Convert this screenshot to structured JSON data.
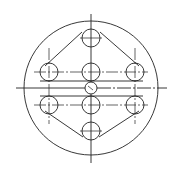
{
  "diagram": {
    "type": "technical-drawing",
    "stroke_color": "#222222",
    "background": "#ffffff",
    "outer_circle": {
      "cx": 91,
      "cy": 88,
      "r": 67
    },
    "center_hole": {
      "cx": 91,
      "cy": 88,
      "r": 6
    },
    "holes": [
      {
        "id": "top",
        "cx": 91,
        "cy": 38,
        "r": 9
      },
      {
        "id": "upper-left",
        "cx": 49,
        "cy": 72,
        "r": 9
      },
      {
        "id": "upper-center",
        "cx": 91,
        "cy": 72,
        "r": 9
      },
      {
        "id": "upper-right",
        "cx": 135,
        "cy": 72,
        "r": 9
      },
      {
        "id": "lower-left",
        "cx": 49,
        "cy": 105,
        "r": 9
      },
      {
        "id": "lower-center",
        "cx": 91,
        "cy": 105,
        "r": 9
      },
      {
        "id": "lower-right",
        "cx": 135,
        "cy": 105,
        "r": 9
      },
      {
        "id": "bottom",
        "cx": 91,
        "cy": 131,
        "r": 9
      }
    ],
    "outline_polygon": "91,29 49,63 49,114 91,140 135,114 135,63",
    "center_lines": {
      "horizontal_main": {
        "x1": 16,
        "y1": 88,
        "x2": 167,
        "y2": 88
      },
      "vertical_main": {
        "x1": 91,
        "y1": 14,
        "x2": 91,
        "y2": 163
      }
    },
    "labels": []
  }
}
